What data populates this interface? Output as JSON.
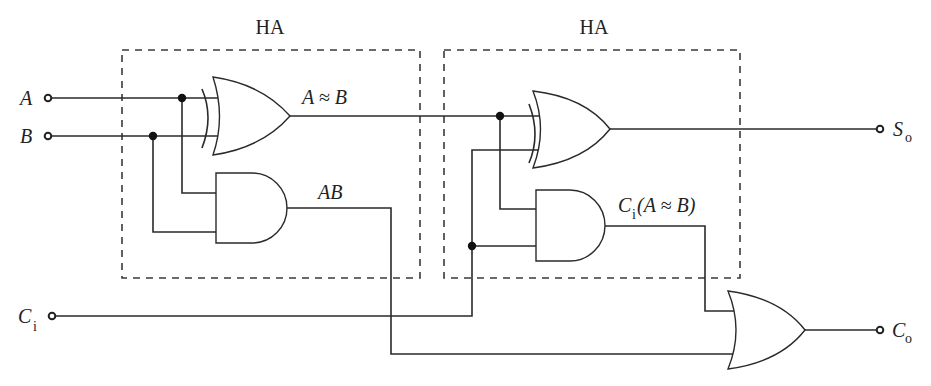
{
  "diagram": {
    "type": "full-adder-logic-circuit",
    "blocks": [
      {
        "id": "ha1",
        "label": "HA"
      },
      {
        "id": "ha2",
        "label": "HA"
      }
    ],
    "inputs": [
      {
        "id": "A",
        "label": "A"
      },
      {
        "id": "B",
        "label": "B"
      },
      {
        "id": "Ci",
        "label": "C",
        "sub": "i"
      }
    ],
    "outputs": [
      {
        "id": "So",
        "label": "S",
        "sub": "o"
      },
      {
        "id": "Co",
        "label": "C",
        "sub": "o"
      }
    ],
    "signal_labels": {
      "xor1_out": "A ≈ B",
      "and1_out": "AB",
      "and2_out_prefix": "C",
      "and2_out_sub": "i",
      "and2_out_rest": "(A ≈ B)"
    },
    "gates": [
      {
        "id": "xor1",
        "type": "XOR",
        "block": "ha1",
        "inputs": [
          "A",
          "B"
        ],
        "output": "A ≈ B"
      },
      {
        "id": "and1",
        "type": "AND",
        "block": "ha1",
        "inputs": [
          "A",
          "B"
        ],
        "output": "AB"
      },
      {
        "id": "xor2",
        "type": "XOR",
        "block": "ha2",
        "inputs": [
          "A ≈ B",
          "Ci"
        ],
        "output": "So"
      },
      {
        "id": "and2",
        "type": "AND",
        "block": "ha2",
        "inputs": [
          "A ≈ B",
          "Ci"
        ],
        "output": "Ci(A ≈ B)"
      },
      {
        "id": "or1",
        "type": "OR",
        "block": null,
        "inputs": [
          "Ci(A ≈ B)",
          "AB"
        ],
        "output": "Co"
      }
    ]
  }
}
